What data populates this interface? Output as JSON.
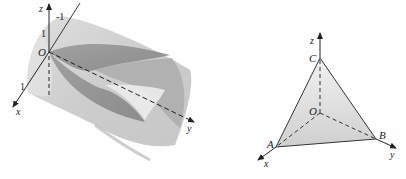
{
  "figures": [
    {
      "id": "left",
      "description": "Intersection of two cylinders along coordinate axes",
      "axes": {
        "x_label": "x",
        "y_label": "y",
        "z_label": "z",
        "origin_label": "O"
      },
      "ticks": {
        "z_tick": "1",
        "neg_tick": "-1",
        "x_tick": "1"
      },
      "colors": {
        "cylinder": "#c8c8c8",
        "inner_surface": "#8f8f8f",
        "highlight": "#e6e6e6",
        "axis": "#222222"
      }
    },
    {
      "id": "right",
      "description": "Tetrahedron OABC with vertices on coordinate axes",
      "axes": {
        "x_label": "x",
        "y_label": "y",
        "z_label": "z",
        "origin_label": "O"
      },
      "vertices": {
        "A": "A",
        "B": "B",
        "C": "C"
      },
      "colors": {
        "face": "#dcdcdc",
        "edge": "#333333",
        "axis": "#222222"
      }
    }
  ]
}
